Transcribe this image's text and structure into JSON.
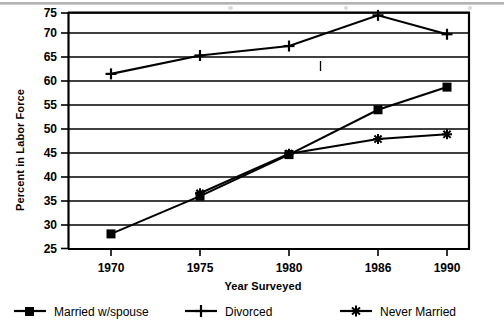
{
  "chart_data": {
    "type": "line",
    "title": "",
    "xlabel": "Year Surveyed",
    "ylabel": "Percent in Labor Force",
    "categories": [
      "1970",
      "1975",
      "1980",
      "1986",
      "1990"
    ],
    "x_tick_labels": [
      "1970",
      "1975",
      "1980",
      "1986",
      "1990"
    ],
    "y_tick_labels": [
      "25",
      "30",
      "35",
      "40",
      "45",
      "50",
      "55",
      "60",
      "65",
      "70",
      "75"
    ],
    "ylim": [
      25,
      75
    ],
    "y_step": 5,
    "grid": "horizontal",
    "legend_position": "bottom",
    "series": [
      {
        "name": "Married w/spouse",
        "marker": "filled-square",
        "values": [
          28.2,
          36.2,
          45.0,
          54.5,
          59.3
        ]
      },
      {
        "name": "Divorced",
        "marker": "plus",
        "values": [
          62.1,
          66.0,
          68.0,
          74.5,
          70.5
        ]
      },
      {
        "name": "Never Married",
        "marker": "asterisk",
        "values": [
          null,
          36.8,
          45.2,
          48.3,
          49.3
        ]
      }
    ],
    "colors": {
      "line": "#000000",
      "grid": "#000000",
      "background": "#ffffff"
    }
  },
  "legend": {
    "items": [
      {
        "label": "Married w/spouse",
        "marker": "filled-square"
      },
      {
        "label": "Divorced",
        "marker": "plus"
      },
      {
        "label": "Never Married",
        "marker": "asterisk"
      }
    ]
  }
}
